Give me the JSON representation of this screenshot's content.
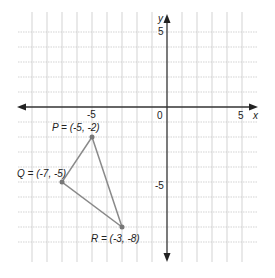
{
  "diagram": {
    "type": "coordinate-plane",
    "axes": {
      "x_label": "x",
      "y_label": "y",
      "x_range": [
        -9,
        5
      ],
      "y_range": [
        -9,
        5
      ],
      "origin_label": "0",
      "x_ticks": [
        {
          "value": -5,
          "label": "-5"
        },
        {
          "value": 5,
          "label": "5"
        }
      ],
      "y_ticks": [
        {
          "value": 5,
          "label": "5"
        },
        {
          "value": -5,
          "label": "-5"
        }
      ]
    },
    "points": [
      {
        "name": "P",
        "x": -5,
        "y": -2,
        "label": "P = (-5, -2)"
      },
      {
        "name": "Q",
        "x": -7,
        "y": -5,
        "label": "Q = (-7, -5)"
      },
      {
        "name": "R",
        "x": -3,
        "y": -8,
        "label": "R = (-3, -8)"
      }
    ],
    "segments": [
      [
        "P",
        "Q"
      ],
      [
        "Q",
        "R"
      ],
      [
        "R",
        "P"
      ]
    ],
    "colors": {
      "grid": "#c8c8c8",
      "axis": "#333333",
      "triangle": "#8a8a8a",
      "point": "#777777",
      "text": "#222222"
    }
  }
}
